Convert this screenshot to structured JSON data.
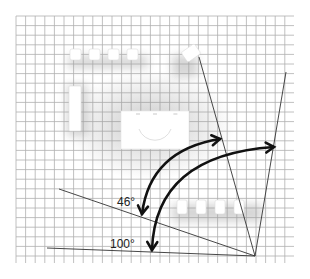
{
  "diagram": {
    "type": "floor-plan-viewing-angle",
    "background": "#ffffff",
    "grid": {
      "x0": 16,
      "y0": 16,
      "x1": 294,
      "y1": 263,
      "spacing": 9.6,
      "color": "#b0b0b0"
    },
    "vertex": {
      "x": 255,
      "y": 256
    },
    "angle_labels": [
      {
        "id": "angle-46",
        "text": "46°",
        "x": 117,
        "y": 206
      },
      {
        "id": "angle-100",
        "text": "100°",
        "x": 110,
        "y": 248
      }
    ],
    "sight_lines": [
      {
        "id": "line-upper-left",
        "x2": 199,
        "y2": 57
      },
      {
        "id": "line-upper-right",
        "x2": 286,
        "y2": 72
      },
      {
        "id": "line-mid-left",
        "x2": 59,
        "y2": 189
      },
      {
        "id": "line-bottom-left",
        "x2": 47,
        "y2": 248
      }
    ],
    "arcs": [
      {
        "id": "arc-46",
        "degrees": 46,
        "from": {
          "x": 142,
          "y": 214
        },
        "to": {
          "x": 220,
          "y": 139
        }
      },
      {
        "id": "arc-100",
        "degrees": 100,
        "from": {
          "x": 152,
          "y": 250
        },
        "to": {
          "x": 274,
          "y": 147
        }
      }
    ],
    "furniture": {
      "top_chairs": [
        {
          "x": 70,
          "y": 49
        },
        {
          "x": 89,
          "y": 49
        },
        {
          "x": 108,
          "y": 49
        },
        {
          "x": 127,
          "y": 49
        }
      ],
      "angled_chair": {
        "x": 183,
        "y": 47,
        "rotate": -35
      },
      "left_bench": {
        "x": 69,
        "y": 86,
        "w": 12,
        "h": 45
      },
      "table": {
        "x": 121,
        "y": 111,
        "w": 68,
        "h": 38
      },
      "bottom_chairs": [
        {
          "x": 177,
          "y": 200
        },
        {
          "x": 196,
          "y": 200
        },
        {
          "x": 215,
          "y": 200
        },
        {
          "x": 234,
          "y": 200
        }
      ]
    }
  }
}
